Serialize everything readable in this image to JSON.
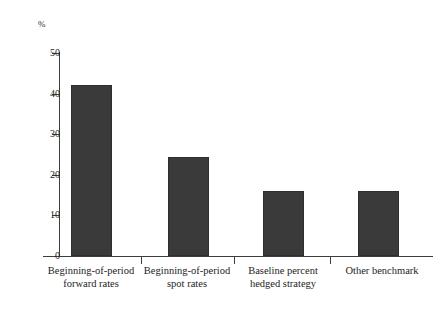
{
  "chart_data": {
    "type": "bar",
    "title": "",
    "subtitle": "",
    "xlabel": "",
    "ylabel": "%",
    "unit_label": "%",
    "categories": [
      "Beginning-of-period\nforward rates",
      "Beginning-of-period\nspot rates",
      "Baseline percent\nhedged strategy",
      "Other benchmark"
    ],
    "values": [
      42,
      24.5,
      16,
      16
    ],
    "ylim": [
      0,
      50
    ],
    "ytick_labels": [
      "0",
      "10",
      "20",
      "30",
      "40",
      "50"
    ],
    "ytick_values": [
      0,
      10,
      20,
      30,
      40,
      50
    ],
    "grid": false,
    "legend": false,
    "legend_position": "none",
    "bar_color": "#3a3a3a",
    "axis_color": "#3d3d3d",
    "background_color": "#ffffff",
    "text_color": "#1d1d1d"
  },
  "axis": {
    "unit": "%",
    "ticks": [
      {
        "label": "50",
        "value": 50
      },
      {
        "label": "40",
        "value": 40
      },
      {
        "label": "30",
        "value": 30
      },
      {
        "label": "20",
        "value": 20
      },
      {
        "label": "10",
        "value": 10
      },
      {
        "label": "0",
        "value": 0
      }
    ]
  },
  "bars": [
    {
      "label": "Beginning-of-period\nforward rates",
      "value": 42
    },
    {
      "label": "Beginning-of-period\nspot rates",
      "value": 24.5
    },
    {
      "label": "Baseline percent\nhedged strategy",
      "value": 16
    },
    {
      "label": "Other benchmark",
      "value": 16
    }
  ]
}
